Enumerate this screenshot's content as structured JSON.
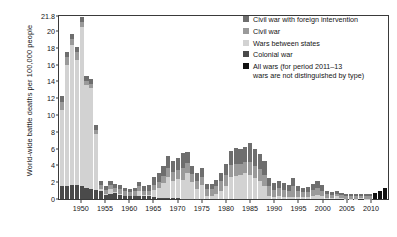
{
  "chart_data": {
    "type": "bar",
    "title": "",
    "subtitle": "",
    "xlabel": "",
    "ylabel": "World-wide battle deaths per 100,000 people",
    "ylim": [
      0,
      21.8
    ],
    "yticks": [
      0,
      2,
      4,
      6,
      8,
      10,
      12,
      14,
      16,
      18,
      20,
      21.8
    ],
    "ytick_labels": [
      "0",
      "2",
      "4",
      "6",
      "8",
      "10",
      "12",
      "14",
      "16",
      "18",
      "20",
      "21.8"
    ],
    "xlim": [
      1946,
      2013
    ],
    "xticks": [
      1950,
      1955,
      1960,
      1965,
      1970,
      1975,
      1980,
      1985,
      1990,
      1995,
      2000,
      2005,
      2010
    ],
    "xtick_labels": [
      "1950",
      "1955",
      "1960",
      "1965",
      "1970",
      "1975",
      "1980",
      "1985",
      "1990",
      "1995",
      "2000",
      "2005",
      "2010"
    ],
    "grid": false,
    "stacked": true,
    "legend_position": "top-right",
    "categories": [
      1946,
      1947,
      1948,
      1949,
      1950,
      1951,
      1952,
      1953,
      1954,
      1955,
      1956,
      1957,
      1958,
      1959,
      1960,
      1961,
      1962,
      1963,
      1964,
      1965,
      1966,
      1967,
      1968,
      1969,
      1970,
      1971,
      1972,
      1973,
      1974,
      1975,
      1976,
      1977,
      1978,
      1979,
      1980,
      1981,
      1982,
      1983,
      1984,
      1985,
      1986,
      1987,
      1988,
      1989,
      1990,
      1991,
      1992,
      1993,
      1994,
      1995,
      1996,
      1997,
      1998,
      1999,
      2000,
      2001,
      2002,
      2003,
      2004,
      2005,
      2006,
      2007,
      2008,
      2009,
      2010,
      2011,
      2012,
      2013
    ],
    "series": [
      {
        "name": "Colonial war",
        "color": "#4a4a4a",
        "values": [
          1.5,
          1.6,
          1.7,
          1.7,
          1.5,
          1.3,
          1.2,
          1.1,
          1.0,
          0.5,
          0.6,
          0.7,
          0.5,
          0.3,
          0.3,
          0.3,
          0.4,
          0.3,
          0.3,
          0.2,
          0.15,
          0.1,
          0.1,
          0.1,
          0.1,
          0.05,
          0.05,
          0.05,
          0.05,
          0.05,
          0,
          0,
          0,
          0,
          0,
          0,
          0,
          0,
          0,
          0,
          0,
          0,
          0,
          0,
          0,
          0,
          0,
          0,
          0,
          0,
          0,
          0,
          0,
          0,
          0,
          0,
          0,
          0,
          0,
          0,
          0,
          0,
          0,
          0,
          0,
          0,
          0,
          0
        ]
      },
      {
        "name": "Wars between states",
        "color": "#d2d2d2",
        "values": [
          9.1,
          14.4,
          16.6,
          14.9,
          19.0,
          12.3,
          12.0,
          6.6,
          0.2,
          0.1,
          0.6,
          0.1,
          0.1,
          0.1,
          0.1,
          0.1,
          0.5,
          0.2,
          0.2,
          0.9,
          1.2,
          1.8,
          2.5,
          2.1,
          2.3,
          2.2,
          3.1,
          2.0,
          1.2,
          1.6,
          0.3,
          0.3,
          0.6,
          0.9,
          1.6,
          2.6,
          2.8,
          2.9,
          3.1,
          2.9,
          2.5,
          2.2,
          1.6,
          0.4,
          0.2,
          0.3,
          0.2,
          0.2,
          0.2,
          0.2,
          0.2,
          0.2,
          0.4,
          0.5,
          0.4,
          0.15,
          0.1,
          0.3,
          0.1,
          0.05,
          0.05,
          0.05,
          0.1,
          0.05,
          0.05,
          0,
          0,
          0
        ]
      },
      {
        "name": "Civil war",
        "color": "#9a9a9a",
        "values": [
          1.0,
          0.9,
          0.8,
          0.9,
          0.6,
          0.5,
          0.5,
          0.5,
          0.5,
          0.5,
          0.5,
          0.5,
          0.6,
          0.5,
          0.4,
          0.5,
          0.6,
          0.5,
          0.5,
          0.6,
          0.7,
          0.9,
          1.1,
          1.0,
          1.1,
          1.5,
          1.1,
          0.9,
          0.9,
          1.0,
          0.9,
          0.9,
          1.0,
          1.2,
          1.3,
          1.4,
          1.4,
          1.3,
          1.3,
          1.5,
          1.4,
          1.4,
          1.3,
          1.1,
          0.9,
          1.0,
          0.9,
          0.8,
          1.4,
          0.7,
          0.6,
          0.6,
          0.7,
          0.8,
          0.6,
          0.45,
          0.4,
          0.35,
          0.35,
          0.3,
          0.3,
          0.3,
          0.3,
          0.3,
          0.3,
          0,
          0,
          0
        ]
      },
      {
        "name": "Civil war with foreign intervention",
        "color": "#6e6e6e",
        "values": [
          0.7,
          0.6,
          0.6,
          0.6,
          0.6,
          0.6,
          0.6,
          0.6,
          0.5,
          0.5,
          0.5,
          0.5,
          0.5,
          0.4,
          0.4,
          0.4,
          0.5,
          0.6,
          0.7,
          0.9,
          1.0,
          1.1,
          1.4,
          1.3,
          1.4,
          1.7,
          1.3,
          1.0,
          0.9,
          1.0,
          0.6,
          0.6,
          0.7,
          1.0,
          1.3,
          1.7,
          1.9,
          1.7,
          1.8,
          2.3,
          2.1,
          1.8,
          1.6,
          1.0,
          0.8,
          0.9,
          0.8,
          0.7,
          0.9,
          0.6,
          0.5,
          0.6,
          0.7,
          0.9,
          0.7,
          0.35,
          0.3,
          0.35,
          0.25,
          0.2,
          0.2,
          0.2,
          0.25,
          0.2,
          0.2,
          0,
          0,
          0
        ]
      },
      {
        "name": "All wars (for period 2011–13 wars are not distinguished by type)",
        "color": "#111111",
        "values": [
          0,
          0,
          0,
          0,
          0,
          0,
          0,
          0,
          0,
          0,
          0,
          0,
          0,
          0,
          0,
          0,
          0,
          0,
          0,
          0,
          0,
          0,
          0,
          0,
          0,
          0,
          0,
          0,
          0,
          0,
          0,
          0,
          0,
          0,
          0,
          0,
          0,
          0,
          0,
          0,
          0,
          0,
          0,
          0,
          0,
          0,
          0,
          0,
          0,
          0,
          0,
          0,
          0,
          0,
          0,
          0,
          0,
          0,
          0,
          0,
          0,
          0,
          0,
          0,
          0,
          0.7,
          1.0,
          1.3
        ]
      }
    ]
  },
  "legend": {
    "items": [
      {
        "label": "Civil war with foreign intervention",
        "color": "#6e6e6e"
      },
      {
        "label": "Civil war",
        "color": "#9a9a9a"
      },
      {
        "label": "Wars between states",
        "color": "#d2d2d2"
      },
      {
        "label": "Colonial war",
        "color": "#4a4a4a"
      },
      {
        "label": "All wars (for period 2011–13\nwars are not distinguished by type)",
        "color": "#111111"
      }
    ]
  }
}
